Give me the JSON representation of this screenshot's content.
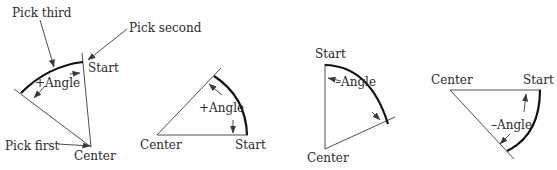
{
  "figure": {
    "colors": {
      "lines": "#3a3a3a",
      "arc": "#111111",
      "text": "#2a2a2a",
      "background": "#ffffff"
    }
  },
  "diagrams": [
    {
      "id": "pick-order",
      "labels": {
        "pick_third": "Pick third",
        "pick_second": "Pick second",
        "pick_first": "Pick first",
        "start": "Start",
        "center": "Center",
        "angle": "+Angle"
      }
    },
    {
      "id": "positive-angle",
      "labels": {
        "center": "Center",
        "start": "Start",
        "angle": "+Angle"
      }
    },
    {
      "id": "negative-angle-vertical",
      "labels": {
        "start": "Start",
        "center": "Center",
        "angle": "–Angle"
      }
    },
    {
      "id": "negative-angle-horizontal",
      "labels": {
        "center": "Center",
        "start": "Start",
        "angle": "–Angle"
      }
    }
  ]
}
